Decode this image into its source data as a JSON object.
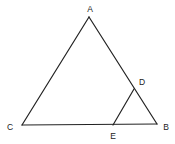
{
  "diagram": {
    "type": "geometry-triangle",
    "stroke_color": "#222222",
    "background": "#ffffff",
    "points": {
      "A": {
        "label": "A",
        "x": 89,
        "y": 17,
        "label_x": 90,
        "label_y": 12
      },
      "B": {
        "label": "B",
        "x": 157,
        "y": 124,
        "label_x": 166,
        "label_y": 130
      },
      "C": {
        "label": "C",
        "x": 22,
        "y": 125,
        "label_x": 10,
        "label_y": 130
      },
      "D": {
        "label": "D",
        "x": 134,
        "y": 89,
        "label_x": 142,
        "label_y": 85
      },
      "E": {
        "label": "E",
        "x": 113,
        "y": 125,
        "label_x": 113,
        "label_y": 139
      }
    },
    "segments": [
      {
        "from": "A",
        "to": "B"
      },
      {
        "from": "A",
        "to": "C"
      },
      {
        "from": "C",
        "to": "B"
      },
      {
        "from": "D",
        "to": "E"
      }
    ]
  }
}
